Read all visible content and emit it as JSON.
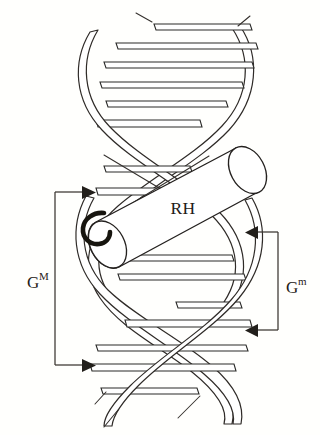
{
  "figure": {
    "kind": "dna-double-helix-with-recognition-helix",
    "background_color": "#fffffd",
    "ink_color": "#2a2a28",
    "width": 320,
    "height": 435
  },
  "labels": {
    "recognition_helix": "RH",
    "major_groove_base": "G",
    "major_groove_sup": "M",
    "minor_groove_base": "G",
    "minor_groove_sup": "m"
  },
  "annotations": {
    "major_groove_bracket": {
      "side": "left",
      "top_y": 192,
      "bottom_y": 365,
      "spine_x": 55,
      "arrow_direction": "right"
    },
    "minor_groove_bracket": {
      "side": "right",
      "top_y": 232,
      "bottom_y": 330,
      "spine_x": 278,
      "arrow_direction": "left"
    }
  },
  "helix": {
    "turns": 2.6,
    "axis_x": 160,
    "top_y": 18,
    "bottom_y": 420,
    "radius_x": 82,
    "strand_width": 9,
    "base_pair_count": 12
  },
  "cylinder": {
    "label": "RH",
    "tilt_degrees": -28,
    "length": 185,
    "radius": 40,
    "n_terminus_marker": "hook-curl"
  }
}
